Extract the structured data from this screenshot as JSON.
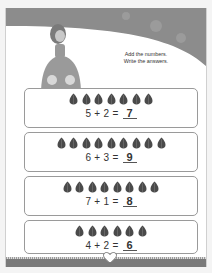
{
  "instructions": {
    "line1": "Add the numbers.",
    "line2": "Write the answers."
  },
  "problems": [
    {
      "a": 5,
      "b": 2,
      "equation": "5 + 2 =",
      "answer": "7",
      "gem_count": 7
    },
    {
      "a": 6,
      "b": 3,
      "equation": "6 + 3 =",
      "answer": "9",
      "gem_count": 9
    },
    {
      "a": 7,
      "b": 1,
      "equation": "7 + 1 =",
      "answer": "8",
      "gem_count": 8
    },
    {
      "a": 4,
      "b": 2,
      "equation": "4 + 2 =",
      "answer": "6",
      "gem_count": 6
    }
  ],
  "colors": {
    "banner": "#8c8c8c",
    "gem": "#4a4a4a",
    "box_border": "#9a9a9a",
    "footer": "#7a7a7a"
  }
}
